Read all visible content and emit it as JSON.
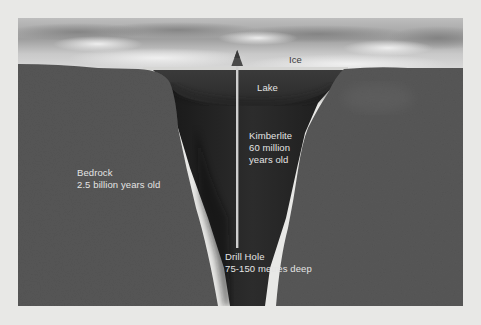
{
  "diagram": {
    "type": "geological-cross-section",
    "labels": {
      "ice": "Ice",
      "lake": "Lake",
      "kimberlite": {
        "line1": "Kimberlite",
        "line2": "60 million",
        "line3": "years old"
      },
      "bedrock": {
        "line1": "Bedrock",
        "line2": "2.5 billion years old"
      },
      "drill_hole": {
        "line1": "Drill Hole",
        "line2": "75-150 metres deep"
      }
    },
    "layers": [
      {
        "name": "ice",
        "color": "#d4d4d2"
      },
      {
        "name": "lake",
        "color": "#2e2e2e"
      },
      {
        "name": "kimberlite",
        "color": "#1f1f1f"
      },
      {
        "name": "bedrock",
        "color": "#555555"
      },
      {
        "name": "sky",
        "color": "#c9c9c9"
      }
    ],
    "colors": {
      "background": "#e8e8e6",
      "text_light": "#e4e4e4",
      "text_dark": "#3a3a3a",
      "drill_line": "#cfcfcf"
    }
  }
}
